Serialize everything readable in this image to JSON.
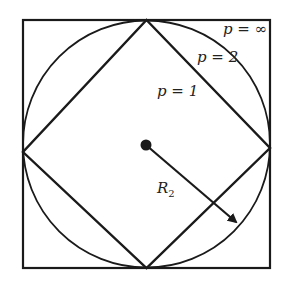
{
  "diagram": {
    "labels": {
      "p_inf": "p = ∞",
      "p_2": "p = 2",
      "p_1": "p = 1",
      "radius_main": "R",
      "radius_sub": "2"
    },
    "shapes": [
      {
        "name": "square",
        "norm": "p=∞"
      },
      {
        "name": "circle",
        "norm": "p=2"
      },
      {
        "name": "diamond",
        "norm": "p=1"
      }
    ],
    "stroke_color": "#1a1a1a",
    "background": "#ffffff"
  }
}
